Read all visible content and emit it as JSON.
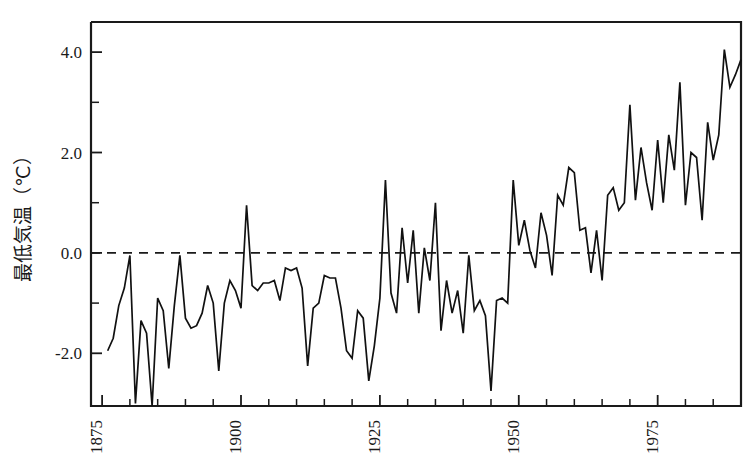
{
  "figure": {
    "background": "#ffffff",
    "line_color": "#111111",
    "axis_color": "#1a1a1a"
  },
  "chart_data": {
    "type": "line",
    "title": "",
    "subtitle": "",
    "xlabel": "",
    "ylabel": "最低気温（℃）",
    "ylabel_parts": {
      "name": "最低気温",
      "unit": "（℃）"
    },
    "xlim": [
      1873,
      1990
    ],
    "ylim": [
      -3.05,
      4.6
    ],
    "grid": false,
    "legend": null,
    "annotations": [
      {
        "kind": "reference-line",
        "axis": "y",
        "value": 0.0,
        "style": "dashed"
      }
    ],
    "x_major_ticks": [
      1875,
      1900,
      1925,
      1950,
      1975
    ],
    "x_major_ticklabels": [
      "1875",
      "1900",
      "1925",
      "1950",
      "1975"
    ],
    "x_minor_ticks": [
      1880,
      1885,
      1890,
      1895,
      1905,
      1910,
      1915,
      1920,
      1930,
      1935,
      1940,
      1945,
      1955,
      1960,
      1965,
      1970,
      1980,
      1985
    ],
    "y_major_ticks": [
      -2.0,
      0.0,
      2.0,
      4.0
    ],
    "y_major_ticklabels": [
      "-2.0",
      "0.0",
      "2.0",
      "4.0"
    ],
    "y_minor_ticks": [
      -1.0,
      1.0,
      3.0
    ],
    "series": [
      {
        "name": "最低気温",
        "x": [
          1876,
          1877,
          1878,
          1879,
          1880,
          1881,
          1882,
          1883,
          1884,
          1885,
          1886,
          1887,
          1888,
          1889,
          1890,
          1891,
          1892,
          1893,
          1894,
          1895,
          1896,
          1897,
          1898,
          1899,
          1900,
          1901,
          1902,
          1903,
          1904,
          1905,
          1906,
          1907,
          1908,
          1909,
          1910,
          1911,
          1912,
          1913,
          1914,
          1915,
          1916,
          1917,
          1918,
          1919,
          1920,
          1921,
          1922,
          1923,
          1924,
          1925,
          1926,
          1927,
          1928,
          1929,
          1930,
          1931,
          1932,
          1933,
          1934,
          1935,
          1936,
          1937,
          1938,
          1939,
          1940,
          1941,
          1942,
          1943,
          1944,
          1945,
          1946,
          1947,
          1948,
          1949,
          1950,
          1951,
          1952,
          1953,
          1954,
          1955,
          1956,
          1957,
          1958,
          1959,
          1960,
          1961,
          1962,
          1963,
          1964,
          1965,
          1966,
          1967,
          1968,
          1969,
          1970,
          1971,
          1972,
          1973,
          1974,
          1975,
          1976,
          1977,
          1978,
          1979,
          1980,
          1981,
          1982,
          1983,
          1984,
          1985,
          1986,
          1987,
          1988,
          1989,
          1990
        ],
        "values": [
          -1.95,
          -1.7,
          -1.05,
          -0.7,
          -0.05,
          -3.0,
          -1.35,
          -1.6,
          -3.05,
          -0.9,
          -1.15,
          -2.3,
          -1.05,
          -0.05,
          -1.3,
          -1.5,
          -1.45,
          -1.2,
          -0.65,
          -1.0,
          -2.35,
          -1.0,
          -0.55,
          -0.75,
          -1.1,
          0.95,
          -0.65,
          -0.75,
          -0.6,
          -0.6,
          -0.55,
          -0.95,
          -0.3,
          -0.35,
          -0.3,
          -0.7,
          -2.25,
          -1.1,
          -1.0,
          -0.45,
          -0.5,
          -0.5,
          -1.1,
          -1.95,
          -2.1,
          -1.15,
          -1.3,
          -2.55,
          -1.85,
          -0.9,
          1.45,
          -0.8,
          -1.2,
          0.5,
          -0.6,
          0.45,
          -1.2,
          0.1,
          -0.55,
          1.0,
          -1.55,
          -0.55,
          -1.2,
          -0.75,
          -1.6,
          -0.05,
          -1.15,
          -0.95,
          -1.25,
          -2.75,
          -0.95,
          -0.9,
          -1.0,
          1.45,
          0.15,
          0.65,
          0.05,
          -0.3,
          0.8,
          0.35,
          -0.45,
          1.15,
          0.95,
          1.7,
          1.6,
          0.45,
          0.5,
          -0.4,
          0.45,
          -0.55,
          1.15,
          1.3,
          0.85,
          1.0,
          2.95,
          1.05,
          2.1,
          1.4,
          0.85,
          2.25,
          1.0,
          2.35,
          1.65,
          3.4,
          0.95,
          2.0,
          1.9,
          0.65,
          2.6,
          1.85,
          2.35,
          4.05,
          3.3,
          3.55,
          3.85
        ]
      }
    ]
  }
}
